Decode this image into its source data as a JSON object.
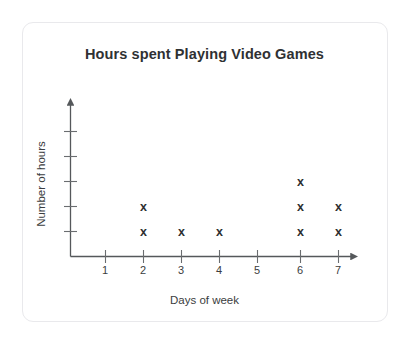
{
  "card": {
    "background_color": "#ffffff",
    "border_color": "#e9e9ec"
  },
  "chart_data": {
    "type": "scatter",
    "plot_style": "dot-plot",
    "title": "Hours spent Playing Video Games",
    "xlabel": "Days of week",
    "ylabel": "Number of hours",
    "categories": [
      "1",
      "2",
      "3",
      "4",
      "5",
      "6",
      "7"
    ],
    "x": [
      1,
      2,
      3,
      4,
      5,
      6,
      7
    ],
    "values": [
      0,
      2,
      1,
      1,
      0,
      3,
      2
    ],
    "marker": "x",
    "marker_color": "#2c2e30",
    "axis_color": "#55585b",
    "grid": false,
    "legend": null,
    "xlim": [
      0,
      8
    ],
    "ylim": [
      0,
      5
    ],
    "x_tick_labels": [
      "1",
      "2",
      "3",
      "4",
      "5",
      "6",
      "7"
    ],
    "y_tick_labels": [
      "",
      "",
      "",
      "",
      ""
    ],
    "y_tick_count": 5,
    "points": [
      {
        "day": "2",
        "stack_index": 1
      },
      {
        "day": "2",
        "stack_index": 2
      },
      {
        "day": "3",
        "stack_index": 1
      },
      {
        "day": "4",
        "stack_index": 1
      },
      {
        "day": "6",
        "stack_index": 1
      },
      {
        "day": "6",
        "stack_index": 2
      },
      {
        "day": "6",
        "stack_index": 3
      },
      {
        "day": "7",
        "stack_index": 1
      },
      {
        "day": "7",
        "stack_index": 2
      }
    ],
    "annotations": []
  }
}
